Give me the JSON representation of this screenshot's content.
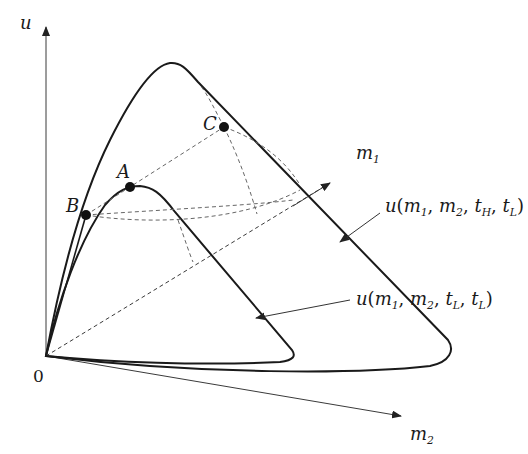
{
  "diagram": {
    "colors": {
      "curve": "#1a1a1a",
      "axis": "#3a3a3a",
      "dashed": "#666666",
      "point": "#111111",
      "background": "#ffffff"
    },
    "axes": {
      "origin_label": "0",
      "u_label": "u",
      "m1_label_base": "m",
      "m1_label_sub": "1",
      "m2_label_base": "m",
      "m2_label_sub": "2"
    },
    "points": [
      {
        "id": "A",
        "label": "A",
        "x": 130,
        "y": 187
      },
      {
        "id": "B",
        "label": "B",
        "x": 86,
        "y": 215
      },
      {
        "id": "C",
        "label": "C",
        "x": 224,
        "y": 127
      }
    ],
    "curve_labels": {
      "high": {
        "prefix": "u",
        "args": [
          {
            "base": "m",
            "sub": "1"
          },
          {
            "base": "m",
            "sub": "2"
          },
          {
            "base": "t",
            "sub": "H"
          },
          {
            "base": "t",
            "sub": "L"
          }
        ]
      },
      "low": {
        "prefix": "u",
        "args": [
          {
            "base": "m",
            "sub": "1"
          },
          {
            "base": "m",
            "sub": "2"
          },
          {
            "base": "t",
            "sub": "L"
          },
          {
            "base": "t",
            "sub": "L"
          }
        ]
      }
    }
  }
}
